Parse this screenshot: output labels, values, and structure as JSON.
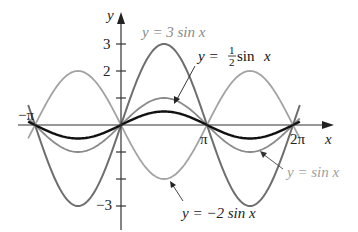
{
  "chart_data": {
    "type": "line",
    "title": "",
    "xlabel": "x",
    "ylabel": "y",
    "xlim": [
      -3.3,
      6.6
    ],
    "ylim": [
      -3.8,
      4.0
    ],
    "grid": false,
    "x_ticks": [
      {
        "value": -3.14159,
        "label": "−π"
      },
      {
        "value": 3.14159,
        "label": "π"
      },
      {
        "value": 6.28318,
        "label": "2π"
      }
    ],
    "y_ticks": [
      {
        "value": 3,
        "label": "3"
      },
      {
        "value": 2,
        "label": "2"
      },
      {
        "value": 1,
        "label": ""
      },
      {
        "value": -1,
        "label": ""
      },
      {
        "value": -2,
        "label": ""
      },
      {
        "value": -3,
        "label": "−3"
      }
    ],
    "series": [
      {
        "name": "y = 3 sin x",
        "amplitude": 3,
        "color": "#6e6e6e",
        "width": 2.0,
        "x": [
          -3.14159,
          -1.5708,
          0,
          1.5708,
          3.14159,
          4.7124,
          6.28318
        ],
        "values": [
          0,
          -3,
          0,
          3,
          0,
          -3,
          0
        ]
      },
      {
        "name": "y = sin x",
        "amplitude": 1,
        "color": "#8a8a8a",
        "width": 1.8,
        "x": [
          -3.14159,
          -1.5708,
          0,
          1.5708,
          3.14159,
          4.7124,
          6.28318
        ],
        "values": [
          0,
          -1,
          0,
          1,
          0,
          -1,
          0
        ]
      },
      {
        "name": "y = −2 sin x",
        "amplitude": -2,
        "color": "#a3a3a3",
        "width": 1.8,
        "x": [
          -3.14159,
          -1.5708,
          0,
          1.5708,
          3.14159,
          4.7124,
          6.28318
        ],
        "values": [
          0,
          2,
          0,
          -2,
          0,
          2,
          0
        ]
      },
      {
        "name": "y = ½ sin x",
        "amplitude": 0.5,
        "color": "#111111",
        "width": 2.4,
        "x": [
          -3.14159,
          -1.5708,
          0,
          1.5708,
          3.14159,
          4.7124,
          6.28318
        ],
        "values": [
          0,
          -0.5,
          0,
          0.5,
          0,
          -0.5,
          0
        ]
      }
    ],
    "annotations": [
      {
        "text": "y = 3 sin x",
        "pos": [
          142,
          37
        ]
      },
      {
        "text": "y = ½ sin x",
        "pos": [
          198,
          60
        ],
        "arrow_to": [
          174,
          103
        ]
      },
      {
        "text": "y = sin x",
        "pos": [
          287,
          177
        ],
        "arrow_to": [
          261,
          152
        ]
      },
      {
        "text": "y = −2 sin x",
        "pos": [
          182,
          216
        ],
        "arrow_to": [
          170,
          181
        ]
      }
    ]
  },
  "labels": {
    "x_axis": "x",
    "y_axis": "y",
    "neg_pi": "−π",
    "pi": "π",
    "two_pi": "2π",
    "y3": "3",
    "y2": "2",
    "yneg3": "−3",
    "ann_3sin_pre": "y = 3 sin ",
    "ann_3sin_var": "x",
    "ann_half_pre": "y = ",
    "ann_half_num": "1",
    "ann_half_den": "2",
    "ann_half_post": " sin ",
    "ann_half_var": "x",
    "ann_sin_pre": "y = sin ",
    "ann_sin_var": "x",
    "ann_m2_pre": "y = −2 sin ",
    "ann_m2_var": "x"
  }
}
